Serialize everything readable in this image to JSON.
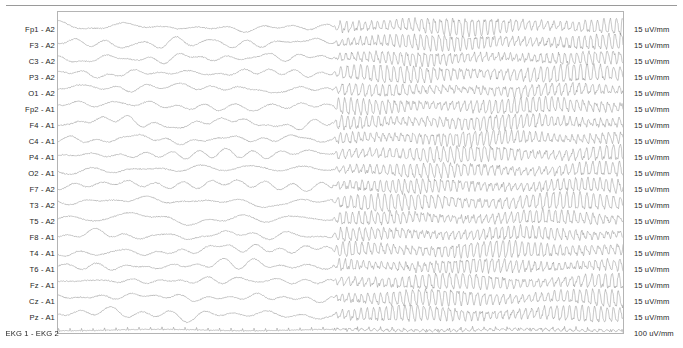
{
  "recording": {
    "type": "eeg-multichannel-strip",
    "montage": "referential",
    "background_color": "#ffffff",
    "trace_color": "#8c8c8c",
    "frame_color": "#b4b4b4",
    "label_color": "#1e1e1e",
    "seizure_onset_x_fraction": 0.487,
    "pre_onset_description": "irregular slow mixed-frequency background activity",
    "post_onset_description": "high-amplitude rhythmic high-frequency generalized discharge"
  },
  "channels": [
    {
      "label": "Fp1 - A2",
      "scale": "15 uV/mm"
    },
    {
      "label": "F3 - A2",
      "scale": "15 uV/mm"
    },
    {
      "label": "C3 - A2",
      "scale": "15 uV/mm"
    },
    {
      "label": "P3 - A2",
      "scale": "15 uV/mm"
    },
    {
      "label": "O1 - A2",
      "scale": "15 uV/mm"
    },
    {
      "label": "Fp2 - A1",
      "scale": "15 uV/mm"
    },
    {
      "label": "F4 - A1",
      "scale": "15 uV/mm"
    },
    {
      "label": "C4 - A1",
      "scale": "15 uV/mm"
    },
    {
      "label": "P4 - A1",
      "scale": "15 uV/mm"
    },
    {
      "label": "O2 - A1",
      "scale": "15 uV/mm"
    },
    {
      "label": "F7 - A2",
      "scale": "15 uV/mm"
    },
    {
      "label": "T3 - A2",
      "scale": "15 uV/mm"
    },
    {
      "label": "T5 - A2",
      "scale": "15 uV/mm"
    },
    {
      "label": "F8 - A1",
      "scale": "15 uV/mm"
    },
    {
      "label": "T4 - A1",
      "scale": "15 uV/mm"
    },
    {
      "label": "T6 - A1",
      "scale": "15 uV/mm"
    },
    {
      "label": "Fz - A1",
      "scale": "15 uV/mm"
    },
    {
      "label": "Cz - A1",
      "scale": "15 uV/mm"
    },
    {
      "label": "Pz - A1",
      "scale": "15 uV/mm"
    },
    {
      "label": "EKG 1 - EKG 2",
      "scale": "100 uV/mm"
    }
  ]
}
